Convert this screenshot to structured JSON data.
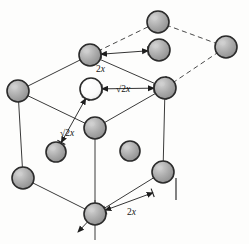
{
  "figure": {
    "type": "crystal-lattice-diagram",
    "background_color": "#fdfdfc",
    "line_color": "#3a3a3a",
    "atom_fill": "#a9a9a9",
    "atom_outline": "#2b2b2b",
    "open_atom_fill": "#ffffff"
  },
  "labels": [
    {
      "id": "top-edge",
      "text": "2x",
      "radical": false,
      "x": 96,
      "y": 64
    },
    {
      "id": "upper-diag",
      "text": "2x",
      "radical": true,
      "x": 116,
      "y": 84
    },
    {
      "id": "lower-diag",
      "text": "2x",
      "radical": true,
      "x": 60,
      "y": 128
    },
    {
      "id": "bottom-edge",
      "text": "2x",
      "radical": false,
      "x": 127,
      "y": 207
    }
  ],
  "atoms": [
    {
      "id": "corner-back-top",
      "cx": 158,
      "cy": 22,
      "r": 11,
      "open": false
    },
    {
      "id": "corner-top-left",
      "cx": 90,
      "cy": 55,
      "r": 11,
      "open": false
    },
    {
      "id": "face-top-right",
      "cx": 159,
      "cy": 50,
      "r": 11,
      "open": false
    },
    {
      "id": "corner-back-right",
      "cx": 226,
      "cy": 47,
      "r": 11,
      "open": false
    },
    {
      "id": "face-top-center-open",
      "cx": 91,
      "cy": 89,
      "r": 11,
      "open": true
    },
    {
      "id": "corner-left-mid",
      "cx": 18,
      "cy": 91,
      "r": 11,
      "open": false
    },
    {
      "id": "corner-right-mid",
      "cx": 165,
      "cy": 88,
      "r": 11,
      "open": false
    },
    {
      "id": "corner-front-top",
      "cx": 95,
      "cy": 128,
      "r": 11,
      "open": false
    },
    {
      "id": "face-left",
      "cx": 56,
      "cy": 152,
      "r": 10,
      "open": false
    },
    {
      "id": "face-front",
      "cx": 130,
      "cy": 151,
      "r": 10,
      "open": false
    },
    {
      "id": "corner-left-bottom",
      "cx": 23,
      "cy": 178,
      "r": 11,
      "open": false
    },
    {
      "id": "corner-right-bottom",
      "cx": 163,
      "cy": 172,
      "r": 11,
      "open": false
    },
    {
      "id": "corner-front-bottom",
      "cx": 95,
      "cy": 214,
      "r": 11,
      "open": false
    }
  ],
  "edges": {
    "solid": [
      [
        90,
        55,
        18,
        91
      ],
      [
        90,
        55,
        165,
        88
      ],
      [
        18,
        91,
        95,
        128
      ],
      [
        165,
        88,
        95,
        128
      ],
      [
        18,
        91,
        23,
        178
      ],
      [
        165,
        88,
        163,
        172
      ],
      [
        95,
        128,
        95,
        214
      ],
      [
        23,
        178,
        95,
        214
      ],
      [
        163,
        172,
        95,
        214
      ]
    ],
    "dashed": [
      [
        90,
        55,
        158,
        22
      ],
      [
        158,
        22,
        226,
        47
      ],
      [
        226,
        47,
        165,
        88
      ]
    ]
  },
  "arrows": [
    {
      "id": "arrow-top-edge",
      "x1": 90,
      "y1": 55,
      "x2": 159,
      "y2": 50
    },
    {
      "id": "arrow-upper-diag",
      "x1": 91,
      "y1": 89,
      "x2": 165,
      "y2": 88
    },
    {
      "id": "arrow-lower-diag",
      "x1": 91,
      "y1": 89,
      "x2": 56,
      "y2": 152
    },
    {
      "id": "arrow-bottom-edge",
      "x1": 95,
      "y1": 214,
      "x2": 163,
      "y2": 189
    }
  ]
}
